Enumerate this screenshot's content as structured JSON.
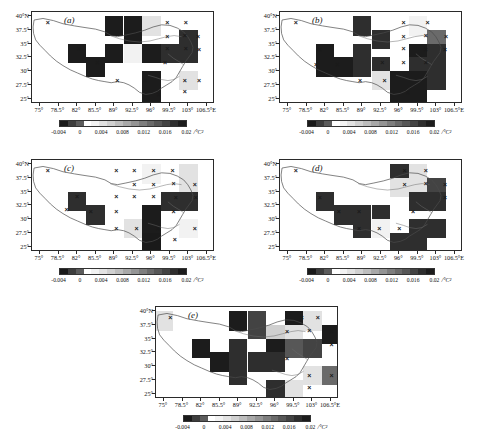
{
  "figure": {
    "top_caption_fragment": "",
    "panel_count": 5
  },
  "axes": {
    "x_ticks": [
      "75°",
      "78.5°",
      "82°",
      "85.5°",
      "89°",
      "92.5°",
      "96°",
      "99.5°",
      "103°",
      "106.5°E"
    ],
    "x_values": [
      75,
      78.5,
      82,
      85.5,
      89,
      92.5,
      96,
      99.5,
      103,
      106.5
    ],
    "y_ticks": [
      "40°N",
      "37.5°",
      "35°",
      "32.5°",
      "30°",
      "27.5°",
      "25°"
    ],
    "y_values": [
      40,
      37.5,
      35,
      32.5,
      30,
      27.5,
      25
    ],
    "xlim": [
      73.5,
      108.0
    ],
    "ylim": [
      24.0,
      40.8
    ]
  },
  "colorbar": {
    "tick_labels": [
      "-0.004",
      "0",
      "0.004",
      "0.008",
      "0.012",
      "0.016",
      "0.02"
    ],
    "tick_values": [
      -0.004,
      0,
      0.004,
      0.008,
      0.012,
      0.016,
      0.02
    ],
    "unit": "/°C²",
    "vmin": -0.004,
    "vmax": 0.02,
    "colors": [
      "#1a1a1a",
      "#3d3d3d",
      "#5c5c5c",
      "#ffffff",
      "#f2f2f2",
      "#e2e2e2",
      "#d0d0d0",
      "#bdbdbd",
      "#a8a8a8",
      "#949494",
      "#7e7e7e",
      "#6a6a6a",
      "#575757",
      "#434343",
      "#2e2e2e",
      "#1c1c1c"
    ]
  },
  "panels": [
    {
      "id": "a",
      "label": "(a)"
    },
    {
      "id": "b",
      "label": "(b)"
    },
    {
      "id": "c",
      "label": "(c)"
    },
    {
      "id": "d",
      "label": "(d)"
    },
    {
      "id": "e",
      "label": "(e)"
    }
  ],
  "chart_data": {
    "type": "heatmap",
    "title": "",
    "xlabel": "",
    "ylabel": "",
    "grid": false,
    "legend": "below each panel",
    "cell_size_deg": 3.5,
    "unit": "/°C²",
    "vmin": -0.004,
    "vmax": 0.02,
    "significance_marker": "×",
    "panels": [
      {
        "id": "a",
        "label": "(a)",
        "cells": [
          {
            "x": 89.0,
            "y": 38.25,
            "v": 0.019
          },
          {
            "x": 92.5,
            "y": 38.25,
            "v": 0.019
          },
          {
            "x": 96.0,
            "y": 38.25,
            "v": 0.0035
          },
          {
            "x": 99.5,
            "y": 38.25,
            "v": 0.0015
          },
          {
            "x": 92.5,
            "y": 35.75,
            "v": 0.019
          },
          {
            "x": 103.0,
            "y": 35.75,
            "v": 0.018
          },
          {
            "x": 82.0,
            "y": 33.25,
            "v": 0.019
          },
          {
            "x": 89.0,
            "y": 33.25,
            "v": 0.019
          },
          {
            "x": 92.5,
            "y": 33.25,
            "v": 0.0022
          },
          {
            "x": 96.0,
            "y": 33.25,
            "v": 0.019
          },
          {
            "x": 99.5,
            "y": 33.25,
            "v": 0.018
          },
          {
            "x": 103.0,
            "y": 33.25,
            "v": 0.018
          },
          {
            "x": 85.5,
            "y": 30.75,
            "v": 0.019
          },
          {
            "x": 96.0,
            "y": 28.25,
            "v": 0.019
          },
          {
            "x": 103.0,
            "y": 28.25,
            "v": 0.0035
          },
          {
            "x": 96.0,
            "y": 25.75,
            "v": 0.019
          }
        ],
        "significant_points": [
          {
            "x": 76.5,
            "y": 39.0
          },
          {
            "x": 99.0,
            "y": 39.0
          },
          {
            "x": 102.5,
            "y": 39.0
          },
          {
            "x": 99.0,
            "y": 36.5
          },
          {
            "x": 102.3,
            "y": 36.6
          },
          {
            "x": 104.8,
            "y": 36.4
          },
          {
            "x": 82.3,
            "y": 34.2
          },
          {
            "x": 85.8,
            "y": 31.6
          },
          {
            "x": 99.0,
            "y": 34.2
          },
          {
            "x": 102.5,
            "y": 34.2
          },
          {
            "x": 105.0,
            "y": 34.0
          },
          {
            "x": 98.6,
            "y": 31.6
          },
          {
            "x": 89.6,
            "y": 28.3
          },
          {
            "x": 94.8,
            "y": 28.3
          },
          {
            "x": 102.3,
            "y": 28.3
          },
          {
            "x": 105.0,
            "y": 28.3
          },
          {
            "x": 97.4,
            "y": 25.9
          },
          {
            "x": 102.3,
            "y": 26.4
          }
        ]
      },
      {
        "id": "b",
        "label": "(b)",
        "cells": [
          {
            "x": 89.0,
            "y": 38.25,
            "v": 0.018
          },
          {
            "x": 99.5,
            "y": 38.25,
            "v": 0.0025
          },
          {
            "x": 92.5,
            "y": 35.75,
            "v": 0.018
          },
          {
            "x": 103.0,
            "y": 35.75,
            "v": 0.013
          },
          {
            "x": 82.0,
            "y": 33.25,
            "v": 0.019
          },
          {
            "x": 89.0,
            "y": 33.25,
            "v": 0.017
          },
          {
            "x": 99.5,
            "y": 33.25,
            "v": 0.019
          },
          {
            "x": 103.0,
            "y": 33.25,
            "v": 0.017
          },
          {
            "x": 82.0,
            "y": 30.75,
            "v": 0.019
          },
          {
            "x": 85.5,
            "y": 30.75,
            "v": 0.019
          },
          {
            "x": 89.0,
            "y": 30.75,
            "v": 0.017
          },
          {
            "x": 92.5,
            "y": 30.75,
            "v": 0.017
          },
          {
            "x": 99.5,
            "y": 30.75,
            "v": 0.018
          },
          {
            "x": 103.0,
            "y": 30.75,
            "v": 0.017
          },
          {
            "x": 92.5,
            "y": 28.25,
            "v": 0.0035
          },
          {
            "x": 96.0,
            "y": 28.25,
            "v": 0.019
          },
          {
            "x": 99.5,
            "y": 28.25,
            "v": 0.019
          },
          {
            "x": 103.0,
            "y": 28.25,
            "v": 0.018
          },
          {
            "x": 96.0,
            "y": 25.75,
            "v": 0.019
          },
          {
            "x": 99.5,
            "y": 25.75,
            "v": 0.019
          }
        ],
        "significant_points": [
          {
            "x": 76.5,
            "y": 39.0
          },
          {
            "x": 96.8,
            "y": 39.0
          },
          {
            "x": 101.3,
            "y": 39.0
          },
          {
            "x": 96.8,
            "y": 36.5
          },
          {
            "x": 101.0,
            "y": 36.6
          },
          {
            "x": 104.8,
            "y": 36.4
          },
          {
            "x": 81.0,
            "y": 34.0
          },
          {
            "x": 96.8,
            "y": 34.2
          },
          {
            "x": 101.0,
            "y": 34.0
          },
          {
            "x": 104.6,
            "y": 34.0
          },
          {
            "x": 80.3,
            "y": 31.3
          },
          {
            "x": 84.3,
            "y": 31.3
          },
          {
            "x": 92.8,
            "y": 31.6
          },
          {
            "x": 96.8,
            "y": 31.6
          },
          {
            "x": 101.0,
            "y": 31.6
          },
          {
            "x": 88.6,
            "y": 28.3
          },
          {
            "x": 93.2,
            "y": 28.3
          },
          {
            "x": 97.6,
            "y": 26.2
          }
        ]
      },
      {
        "id": "c",
        "label": "(c)",
        "cells": [
          {
            "x": 92.5,
            "y": 38.25,
            "v": 0.0015
          },
          {
            "x": 96.0,
            "y": 38.25,
            "v": 0.0022
          },
          {
            "x": 103.0,
            "y": 38.25,
            "v": 0.0035
          },
          {
            "x": 103.0,
            "y": 35.75,
            "v": 0.0035
          },
          {
            "x": 82.0,
            "y": 33.25,
            "v": 0.018
          },
          {
            "x": 99.5,
            "y": 33.25,
            "v": 0.017
          },
          {
            "x": 103.0,
            "y": 33.25,
            "v": 0.017
          },
          {
            "x": 85.5,
            "y": 30.75,
            "v": 0.018
          },
          {
            "x": 96.0,
            "y": 30.75,
            "v": 0.019
          },
          {
            "x": 92.5,
            "y": 28.25,
            "v": 0.0035
          },
          {
            "x": 96.0,
            "y": 28.25,
            "v": 0.019
          },
          {
            "x": 103.0,
            "y": 28.25,
            "v": 0.0025
          },
          {
            "x": 96.0,
            "y": 25.75,
            "v": -0.003
          }
        ],
        "significant_points": [
          {
            "x": 76.5,
            "y": 39.0
          },
          {
            "x": 89.4,
            "y": 39.0
          },
          {
            "x": 92.8,
            "y": 39.0
          },
          {
            "x": 96.4,
            "y": 39.0
          },
          {
            "x": 100.0,
            "y": 39.0
          },
          {
            "x": 92.8,
            "y": 36.4
          },
          {
            "x": 96.4,
            "y": 36.4
          },
          {
            "x": 100.2,
            "y": 36.6
          },
          {
            "x": 104.2,
            "y": 36.4
          },
          {
            "x": 82.0,
            "y": 34.2
          },
          {
            "x": 89.4,
            "y": 34.2
          },
          {
            "x": 92.8,
            "y": 34.2
          },
          {
            "x": 96.4,
            "y": 34.2
          },
          {
            "x": 100.6,
            "y": 34.1
          },
          {
            "x": 104.4,
            "y": 34.0
          },
          {
            "x": 80.0,
            "y": 31.8
          },
          {
            "x": 84.6,
            "y": 31.4
          },
          {
            "x": 89.4,
            "y": 31.4
          },
          {
            "x": 100.2,
            "y": 31.4
          },
          {
            "x": 89.4,
            "y": 28.4
          },
          {
            "x": 93.2,
            "y": 28.4
          },
          {
            "x": 97.2,
            "y": 28.4
          },
          {
            "x": 104.2,
            "y": 28.4
          },
          {
            "x": 100.4,
            "y": 26.4
          }
        ]
      },
      {
        "id": "d",
        "label": "(d)",
        "cells": [
          {
            "x": 96.0,
            "y": 38.25,
            "v": 0.017
          },
          {
            "x": 99.5,
            "y": 38.25,
            "v": 0.0035
          },
          {
            "x": 96.0,
            "y": 35.75,
            "v": 0.0035
          },
          {
            "x": 99.5,
            "y": 35.75,
            "v": 0.0035
          },
          {
            "x": 103.0,
            "y": 35.75,
            "v": 0.016
          },
          {
            "x": 82.0,
            "y": 33.25,
            "v": 0.018
          },
          {
            "x": 99.5,
            "y": 33.25,
            "v": 0.017
          },
          {
            "x": 103.0,
            "y": 33.25,
            "v": 0.017
          },
          {
            "x": 85.5,
            "y": 30.75,
            "v": 0.018
          },
          {
            "x": 89.0,
            "y": 30.75,
            "v": 0.018
          },
          {
            "x": 92.5,
            "y": 30.75,
            "v": 0.018
          },
          {
            "x": 89.0,
            "y": 28.25,
            "v": 0.018
          },
          {
            "x": 92.5,
            "y": 28.25,
            "v": 0.0025
          },
          {
            "x": 99.5,
            "y": 28.25,
            "v": 0.017
          },
          {
            "x": 103.0,
            "y": 28.25,
            "v": 0.018
          },
          {
            "x": 96.0,
            "y": 25.75,
            "v": 0.017
          },
          {
            "x": 99.5,
            "y": 25.75,
            "v": 0.017
          }
        ],
        "significant_points": [
          {
            "x": 76.5,
            "y": 39.0
          },
          {
            "x": 97.0,
            "y": 39.0
          },
          {
            "x": 101.0,
            "y": 39.0
          },
          {
            "x": 97.0,
            "y": 36.5
          },
          {
            "x": 101.0,
            "y": 36.6
          },
          {
            "x": 104.6,
            "y": 36.4
          },
          {
            "x": 81.0,
            "y": 34.0
          },
          {
            "x": 104.6,
            "y": 34.0
          },
          {
            "x": 84.6,
            "y": 31.4
          },
          {
            "x": 88.4,
            "y": 31.4
          },
          {
            "x": 98.6,
            "y": 31.4
          },
          {
            "x": 88.4,
            "y": 28.4
          },
          {
            "x": 92.2,
            "y": 28.4
          },
          {
            "x": 96.0,
            "y": 28.4
          }
        ]
      },
      {
        "id": "e",
        "label": "(e)",
        "cells": [
          {
            "x": 75.0,
            "y": 38.25,
            "v": 0.0045
          },
          {
            "x": 89.0,
            "y": 38.25,
            "v": 0.019
          },
          {
            "x": 92.5,
            "y": 38.25,
            "v": 0.016
          },
          {
            "x": 99.5,
            "y": 38.25,
            "v": 0.019
          },
          {
            "x": 103.0,
            "y": 38.25,
            "v": 0.0035
          },
          {
            "x": 92.5,
            "y": 35.75,
            "v": 0.016
          },
          {
            "x": 96.0,
            "y": 35.75,
            "v": 0.006
          },
          {
            "x": 99.5,
            "y": 35.75,
            "v": 0.0035
          },
          {
            "x": 106.5,
            "y": 35.75,
            "v": 0.019
          },
          {
            "x": 82.0,
            "y": 33.25,
            "v": 0.019
          },
          {
            "x": 89.0,
            "y": 33.25,
            "v": 0.018
          },
          {
            "x": 92.5,
            "y": 33.25,
            "v": 0.0015
          },
          {
            "x": 96.0,
            "y": 33.25,
            "v": 0.019
          },
          {
            "x": 99.5,
            "y": 33.25,
            "v": 0.015
          },
          {
            "x": 103.0,
            "y": 33.25,
            "v": 0.016
          },
          {
            "x": 85.5,
            "y": 30.75,
            "v": 0.019
          },
          {
            "x": 89.0,
            "y": 30.75,
            "v": 0.017
          },
          {
            "x": 92.5,
            "y": 30.75,
            "v": 0.017
          },
          {
            "x": 96.0,
            "y": 30.75,
            "v": 0.017
          },
          {
            "x": 89.0,
            "y": 28.25,
            "v": 0.017
          },
          {
            "x": 103.0,
            "y": 28.25,
            "v": 0.0035
          },
          {
            "x": 106.5,
            "y": 28.25,
            "v": 0.013
          },
          {
            "x": 96.0,
            "y": 25.75,
            "v": 0.017
          },
          {
            "x": 99.5,
            "y": 25.75,
            "v": 0.0035
          }
        ],
        "significant_points": [
          {
            "x": 76.2,
            "y": 39.0
          },
          {
            "x": 101.0,
            "y": 39.0
          },
          {
            "x": 104.0,
            "y": 39.0
          },
          {
            "x": 98.2,
            "y": 36.5
          },
          {
            "x": 102.4,
            "y": 36.6
          },
          {
            "x": 106.6,
            "y": 36.4
          },
          {
            "x": 106.6,
            "y": 34.0
          },
          {
            "x": 98.2,
            "y": 31.4
          },
          {
            "x": 102.4,
            "y": 28.4
          },
          {
            "x": 106.6,
            "y": 28.4
          },
          {
            "x": 102.4,
            "y": 26.2
          }
        ]
      }
    ]
  }
}
